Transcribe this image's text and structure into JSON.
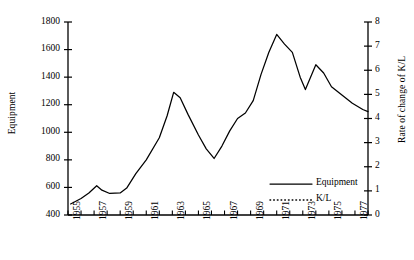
{
  "chart_data": {
    "type": "line",
    "title": "",
    "xlabel": "",
    "ylabel": "Equipment",
    "y2label": "Rate of change of K/L",
    "xlim": [
      1955,
      1978
    ],
    "ylim": [
      400,
      1800
    ],
    "y2lim": [
      0,
      8
    ],
    "ytick_labels": [
      "1800",
      "1600",
      "1400",
      "1200",
      "1000",
      "800",
      "600",
      "400"
    ],
    "ytick_values": [
      1800,
      1600,
      1400,
      1200,
      1000,
      800,
      600,
      400
    ],
    "y2tick_labels": [
      "8",
      "7",
      "6",
      "5",
      "4",
      "3",
      "2",
      "1",
      "0"
    ],
    "y2tick_values": [
      8,
      7,
      6,
      5,
      4,
      3,
      2,
      1,
      0
    ],
    "xtick_labels": [
      "1955",
      "1957",
      "1959",
      "1961",
      "1963",
      "1965",
      "1967",
      "1969",
      "1971",
      "1973",
      "1975",
      "1977"
    ],
    "xtick_values": [
      1955,
      1957,
      1959,
      1961,
      1963,
      1965,
      1967,
      1969,
      1971,
      1973,
      1975,
      1977
    ],
    "x_minor_step": 1,
    "grid": false,
    "legend_position": "inside lower-right",
    "series": [
      {
        "name": "Equipment",
        "axis": "left",
        "style": "solid",
        "color": "#000000",
        "x": [
          1955.2,
          1956,
          1956.6,
          1957.2,
          1957.6,
          1958.2,
          1959,
          1959.5,
          1960.2,
          1961,
          1962,
          1962.6,
          1963.1,
          1963.6,
          1964.2,
          1965,
          1965.6,
          1966.2,
          1966.8,
          1967.4,
          1968,
          1968.6,
          1969.2,
          1969.8,
          1970.4,
          1971,
          1971.6,
          1972.2,
          1972.8,
          1973.2,
          1974,
          1974.6,
          1975.2,
          1976,
          1976.8,
          1977.6,
          1978
        ],
        "y": [
          480,
          520,
          560,
          612,
          580,
          556,
          560,
          595,
          700,
          800,
          960,
          1120,
          1290,
          1250,
          1130,
          980,
          880,
          810,
          900,
          1010,
          1100,
          1140,
          1230,
          1420,
          1580,
          1710,
          1640,
          1580,
          1400,
          1310,
          1490,
          1430,
          1330,
          1270,
          1210,
          1165,
          1150
        ]
      },
      {
        "name": "K/L",
        "axis": "right",
        "style": "dotted",
        "color": "#000000",
        "x": [
          1955.2,
          1955.8,
          1956.3,
          1956.7,
          1957.1,
          1957.5,
          1957.9,
          1958.3,
          1958.8,
          1959.2,
          1959.7,
          1960.2,
          1960.8,
          1961.3,
          1961.8,
          1962.2,
          1962.6,
          1963,
          1963.5,
          1964,
          1964.5,
          1965,
          1965.5,
          1966,
          1966.4,
          1966.8,
          1967.2,
          1967.7,
          1968.2,
          1968.8,
          1969.4,
          1970,
          1970.5,
          1971,
          1971.5,
          1972,
          1972.5,
          1973,
          1973.4,
          1973.9,
          1974.4,
          1974.9,
          1975.3,
          1975.8,
          1976.3,
          1976.9,
          1977.5,
          1978
        ],
        "y": [
          1000,
          870,
          770,
          745,
          800,
          930,
          1070,
          1270,
          1420,
          1430,
          1330,
          1205,
          1205,
          1290,
          1520,
          1700,
          1790,
          1760,
          1700,
          1640,
          1660,
          1560,
          1400,
          1200,
          950,
          700,
          555,
          620,
          740,
          810,
          830,
          800,
          810,
          1110,
          1330,
          1290,
          1240,
          1250,
          1180,
          960,
          810,
          1060,
          1220,
          1230,
          1150,
          1010,
          860,
          790
        ]
      }
    ],
    "legend": [
      {
        "label": "Equipment",
        "style": "solid"
      },
      {
        "label": "K/L",
        "style": "dotted"
      }
    ]
  }
}
